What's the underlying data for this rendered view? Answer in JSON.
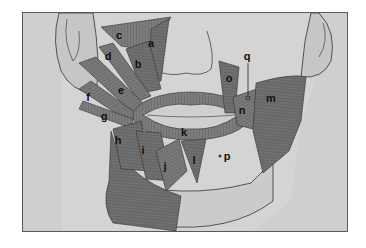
{
  "figure": {
    "colors": {
      "background": "#ffffff",
      "frame_fill": "#cfcfcf",
      "skin": "#d3d3d3",
      "muscle": "#7a7a7a",
      "muscle_dark": "#5e5e5e",
      "outline": "#3a3a3a",
      "label": "#111111"
    },
    "labels": [
      {
        "id": "a",
        "text": "a",
        "x": 150,
        "y": 42
      },
      {
        "id": "b",
        "text": "b",
        "x": 137,
        "y": 63
      },
      {
        "id": "c",
        "text": "c",
        "x": 118,
        "y": 34
      },
      {
        "id": "d",
        "text": "d",
        "x": 107,
        "y": 55
      },
      {
        "id": "e",
        "text": "e",
        "x": 120,
        "y": 89
      },
      {
        "id": "f",
        "text": "f",
        "x": 87,
        "y": 96
      },
      {
        "id": "g",
        "text": "g",
        "x": 103,
        "y": 115
      },
      {
        "id": "h",
        "text": "h",
        "x": 117,
        "y": 139
      },
      {
        "id": "i",
        "text": "i",
        "x": 142,
        "y": 149
      },
      {
        "id": "j",
        "text": "j",
        "x": 164,
        "y": 165
      },
      {
        "id": "k",
        "text": "k",
        "x": 183,
        "y": 131
      },
      {
        "id": "l",
        "text": "l",
        "x": 193,
        "y": 159
      },
      {
        "id": "m",
        "text": "m",
        "x": 270,
        "y": 97
      },
      {
        "id": "n",
        "text": "n",
        "x": 241,
        "y": 109
      },
      {
        "id": "o",
        "text": "o",
        "x": 228,
        "y": 77
      },
      {
        "id": "p",
        "text": "p",
        "x": 226,
        "y": 155
      },
      {
        "id": "q",
        "text": "q",
        "x": 246,
        "y": 55
      }
    ]
  }
}
